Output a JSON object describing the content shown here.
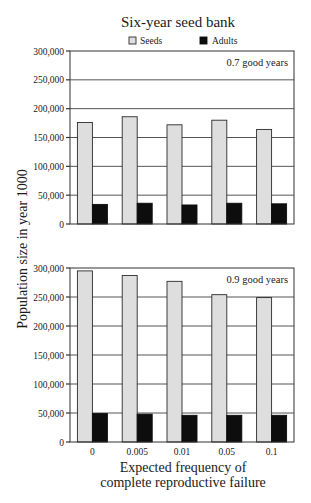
{
  "title": "Six-year seed bank",
  "legend": {
    "seeds_label": "Seeds",
    "adults_label": "Adults"
  },
  "ylabel": "Population size in year 1000",
  "xlabel_line1": "Expected frequency of",
  "xlabel_line2": "complete reproductive failure",
  "colors": {
    "seeds": "#dedede",
    "adults": "#0d0d0d",
    "grid": "#555555"
  },
  "panels": [
    {
      "label": "0.7 good years"
    },
    {
      "label": "0.9 good years"
    }
  ],
  "chart_data": [
    {
      "type": "bar",
      "title": "Six-year seed bank",
      "subtitle": "0.7 good years",
      "xlabel": "Expected frequency of complete reproductive failure",
      "ylabel": "Population size in year 1000",
      "categories": [
        "0",
        "0.005",
        "0.01",
        "0.05",
        "0.1"
      ],
      "series": [
        {
          "name": "Seeds",
          "values": [
            176000,
            186000,
            172000,
            180000,
            164000
          ]
        },
        {
          "name": "Adults",
          "values": [
            34000,
            36000,
            33000,
            36000,
            35000
          ]
        }
      ],
      "ylim": [
        0,
        300000
      ],
      "yticks": [
        "0",
        "50,000",
        "100,000",
        "150,000",
        "200,000",
        "250,000",
        "300,000"
      ],
      "grid": true,
      "legend_position": "top"
    },
    {
      "type": "bar",
      "title": "Six-year seed bank",
      "subtitle": "0.9 good years",
      "xlabel": "Expected frequency of complete reproductive failure",
      "ylabel": "Population size in year 1000",
      "categories": [
        "0",
        "0.005",
        "0.01",
        "0.05",
        "0.1"
      ],
      "series": [
        {
          "name": "Seeds",
          "values": [
            295000,
            287000,
            277000,
            254000,
            249000
          ]
        },
        {
          "name": "Adults",
          "values": [
            49000,
            48000,
            46000,
            46000,
            46000
          ]
        }
      ],
      "ylim": [
        0,
        300000
      ],
      "yticks": [
        "0",
        "50,000",
        "100,000",
        "150,000",
        "200,000",
        "250,000",
        "300,000"
      ],
      "grid": true,
      "legend_position": "top"
    }
  ]
}
